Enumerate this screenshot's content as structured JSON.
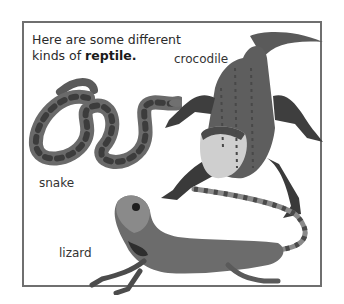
{
  "page": {
    "intro_text": "Here are some different kinds of ",
    "intro_bold": "reptile.",
    "labels": {
      "crocodile": "crocodile",
      "snake": "snake",
      "lizard": "lizard"
    },
    "images": [
      {
        "name": "crocodile",
        "description": "Photo of a crocodile seen from above, mouth open"
      },
      {
        "name": "snake",
        "description": "Photo of a coiled patterned snake"
      },
      {
        "name": "lizard",
        "description": "Photo of a lizard (water dragon) with long curving tail"
      }
    ],
    "colors": {
      "border": "#6f6f6f",
      "text": "#2a2a2a",
      "background": "#ffffff"
    }
  }
}
